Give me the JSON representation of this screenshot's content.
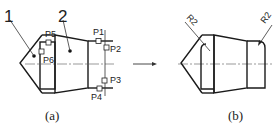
{
  "figure_a": {
    "caption": "(a)",
    "part_labels": [
      "1",
      "2"
    ],
    "point_labels": [
      "P1",
      "P2",
      "P3",
      "P4",
      "P5",
      "P6"
    ]
  },
  "figure_b": {
    "caption": "(b)",
    "radius_labels": [
      "R2",
      "R2"
    ]
  },
  "arrow": "right-arrow",
  "colors": {
    "line": "#1a1a1a",
    "background": "#ffffff"
  }
}
